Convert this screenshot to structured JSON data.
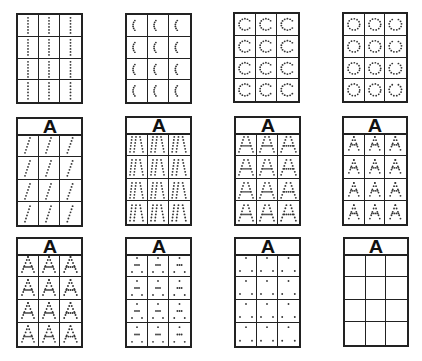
{
  "worksheet": {
    "title": "Letter A tracing progression",
    "letter": "A",
    "colors": {
      "line": "#222222",
      "dot": "#333333",
      "background": "#ffffff"
    },
    "cards": [
      {
        "id": 1,
        "has_header": false,
        "stage": "vertical-dotted-lines",
        "rows": 4,
        "cols": 3
      },
      {
        "id": 2,
        "has_header": false,
        "stage": "curved-dotted-lines",
        "rows": 4,
        "cols": 3
      },
      {
        "id": 3,
        "has_header": false,
        "stage": "dotted-c-shapes",
        "rows": 4,
        "cols": 3
      },
      {
        "id": 4,
        "has_header": false,
        "stage": "mixed-dotted-shapes",
        "rows": 4,
        "cols": 3
      },
      {
        "id": 5,
        "has_header": true,
        "header_label": "A",
        "stage": "slanted-dotted-lines",
        "rows": 4,
        "cols": 3
      },
      {
        "id": 6,
        "has_header": true,
        "header_label": "A",
        "stage": "dotted-a-outline-large",
        "rows": 4,
        "cols": 3
      },
      {
        "id": 7,
        "has_header": true,
        "header_label": "A",
        "stage": "dotted-a-full",
        "rows": 4,
        "cols": 3
      },
      {
        "id": 8,
        "has_header": true,
        "header_label": "A",
        "stage": "dotted-a-smaller",
        "rows": 4,
        "cols": 3
      },
      {
        "id": 9,
        "has_header": true,
        "header_label": "A",
        "stage": "dotted-a-dense",
        "rows": 4,
        "cols": 3
      },
      {
        "id": 10,
        "has_header": true,
        "header_label": "A",
        "stage": "sparse-a-dots",
        "rows": 4,
        "cols": 3
      },
      {
        "id": 11,
        "has_header": true,
        "header_label": "A",
        "stage": "three-point-a",
        "rows": 4,
        "cols": 3
      },
      {
        "id": 12,
        "has_header": true,
        "header_label": "A",
        "stage": "blank-cells",
        "rows": 4,
        "cols": 3
      }
    ]
  }
}
